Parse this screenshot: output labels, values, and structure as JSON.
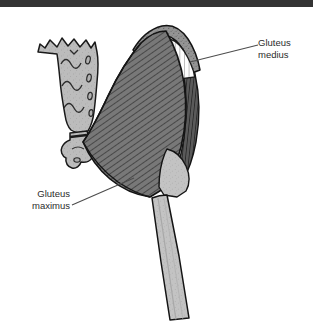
{
  "figure": {
    "kind": "anatomical-illustration",
    "view": "posterior",
    "top_band_color": "#343434",
    "background_color": "#ffffff"
  },
  "labels": [
    {
      "id": "gluteus-medius",
      "line1": "Gluteus",
      "line2": "medius",
      "align": "left",
      "leader": {
        "from_x": 258,
        "from_y": 45,
        "to_x": 190,
        "to_y": 62
      }
    },
    {
      "id": "gluteus-maximus",
      "line1": "Gluteus",
      "line2": "maximus",
      "align": "right",
      "leader": {
        "from_x": 72,
        "from_y": 205,
        "to_x": 134,
        "to_y": 178
      }
    }
  ],
  "structures": [
    {
      "id": "sacrum",
      "name": "Sacrum",
      "fill": "#b9b9b9",
      "texture": "stipple",
      "detail": "four pairs of sacral foramina and transverse ridges"
    },
    {
      "id": "coccyx",
      "name": "Coccyx",
      "fill": "#b9b9b9",
      "texture": "stipple"
    },
    {
      "id": "iliac-crest",
      "name": "Iliac crest",
      "fill": "#8f8f8f",
      "texture": "stipple"
    },
    {
      "id": "gluteus-medius-cut",
      "name": "Gluteus medius (cut surface)",
      "fill": "#ffffff",
      "texture": "vertical-hatch"
    },
    {
      "id": "gluteus-medius-body",
      "name": "Gluteus medius",
      "fill": "#4a4a4a",
      "texture": "vertical-striation"
    },
    {
      "id": "gluteus-maximus",
      "name": "Gluteus maximus",
      "fill": "#707070",
      "texture": "diagonal-striation"
    },
    {
      "id": "greater-trochanter",
      "name": "Greater trochanter",
      "fill": "#b3b3b3",
      "texture": "stipple"
    },
    {
      "id": "femur",
      "name": "Femur shaft",
      "fill": "#c2c2c2",
      "texture": "stipple"
    }
  ],
  "colors": {
    "outline": "#1a1a1a",
    "bone_light": "#c2c2c2",
    "bone_mid": "#b9b9b9",
    "muscle_mid": "#707070",
    "muscle_dark": "#4a4a4a",
    "leader_line": "#4d4d4d"
  }
}
